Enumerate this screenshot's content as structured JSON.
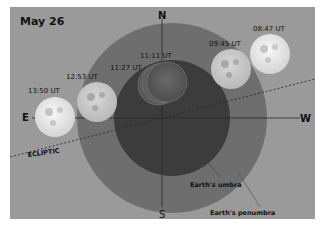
{
  "title": "May 26",
  "compass": {
    "north": "N",
    "south": "S",
    "east": "E",
    "west": "W"
  },
  "ecliptic_label": "ECLIPTIC",
  "shadow_labels": {
    "umbra": "Earth's umbra",
    "penumbra": "Earth's penumbra"
  },
  "moon_positions": [
    {
      "time": "08:47 UT"
    },
    {
      "time": "09:45 UT"
    },
    {
      "time": "11:11 UT"
    },
    {
      "time": "11:27 UT"
    },
    {
      "time": "12:53 UT"
    },
    {
      "time": "13:50 UT"
    }
  ],
  "colors": {
    "background": "#9a9a9a",
    "penumbra": "#6e6e6e",
    "umbra": "#3c3c3c",
    "moon": "#e8e8e8"
  }
}
